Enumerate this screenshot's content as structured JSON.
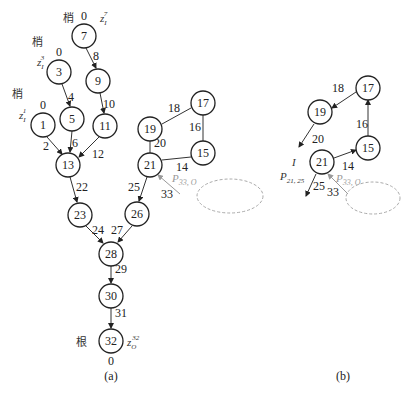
{
  "figure_a": {
    "caption": "(a)",
    "nodes": [
      {
        "id": "7",
        "label": "7"
      },
      {
        "id": "3",
        "label": "3"
      },
      {
        "id": "9",
        "label": "9"
      },
      {
        "id": "1",
        "label": "1"
      },
      {
        "id": "5",
        "label": "5"
      },
      {
        "id": "11",
        "label": "11"
      },
      {
        "id": "13",
        "label": "13"
      },
      {
        "id": "23",
        "label": "23"
      },
      {
        "id": "26",
        "label": "26"
      },
      {
        "id": "19",
        "label": "19"
      },
      {
        "id": "17",
        "label": "17"
      },
      {
        "id": "21",
        "label": "21"
      },
      {
        "id": "15",
        "label": "15"
      },
      {
        "id": "28",
        "label": "28"
      },
      {
        "id": "30",
        "label": "30"
      },
      {
        "id": "32",
        "label": "32"
      }
    ],
    "edges": [
      {
        "from": "7",
        "to": "9",
        "label": "8"
      },
      {
        "from": "3",
        "to": "5",
        "label": "4"
      },
      {
        "from": "9",
        "to": "11",
        "label": "10"
      },
      {
        "from": "1",
        "to": "13",
        "label": "2"
      },
      {
        "from": "5",
        "to": "13",
        "label": "6"
      },
      {
        "from": "11",
        "to": "13",
        "label": "12"
      },
      {
        "from": "13",
        "to": "23",
        "label": "22"
      },
      {
        "from": "23",
        "to": "28",
        "label": "24"
      },
      {
        "from": "26",
        "to": "28",
        "label": "27"
      },
      {
        "from": "21",
        "to": "26",
        "label": "25"
      },
      {
        "from": "19",
        "to": "17",
        "label": "18"
      },
      {
        "from": "17",
        "to": "15",
        "label": "16"
      },
      {
        "from": "19",
        "to": "21",
        "label": "20"
      },
      {
        "from": "21",
        "to": "15",
        "label": "14"
      },
      {
        "from": "28",
        "to": "30",
        "label": "29"
      },
      {
        "from": "30",
        "to": "32",
        "label": "31"
      },
      {
        "from": "ellipse",
        "to": "21",
        "label": "33"
      }
    ],
    "leaf_tag": "梢",
    "root_tag": "根",
    "leaf_weights": {
      "n7": "0",
      "n3": "0",
      "n1": "0"
    },
    "root_weight": "0",
    "z_labels": {
      "z7": "z",
      "z7_sub": "I",
      "z7_sup": "7",
      "z3": "z",
      "z3_sub": "I",
      "z3_sup": "3",
      "z1": "z",
      "z1_sub": "I",
      "z1_sup": "1",
      "z32": "z",
      "z32_sub": "O",
      "z32_sup": "32"
    },
    "gray_label": {
      "main": "P",
      "sub": "33, O"
    }
  },
  "figure_b": {
    "caption": "(b)",
    "nodes": [
      {
        "id": "19",
        "label": "19"
      },
      {
        "id": "17",
        "label": "17"
      },
      {
        "id": "15",
        "label": "15"
      },
      {
        "id": "21",
        "label": "21"
      }
    ],
    "edges": [
      {
        "from": "17",
        "to": "19",
        "label": "18"
      },
      {
        "from": "19",
        "to": "out",
        "label": "20"
      },
      {
        "from": "15",
        "to": "17",
        "label": "16"
      },
      {
        "from": "21",
        "to": "15",
        "label": "14"
      },
      {
        "from": "21",
        "to": "out",
        "label": "25"
      },
      {
        "from": "ellipse",
        "to": "21",
        "label": "33"
      }
    ],
    "i_label": "I",
    "p_label": {
      "main": "P",
      "sub": "21, 25"
    },
    "gray_label": {
      "main": "P",
      "sub": "33, O"
    }
  }
}
